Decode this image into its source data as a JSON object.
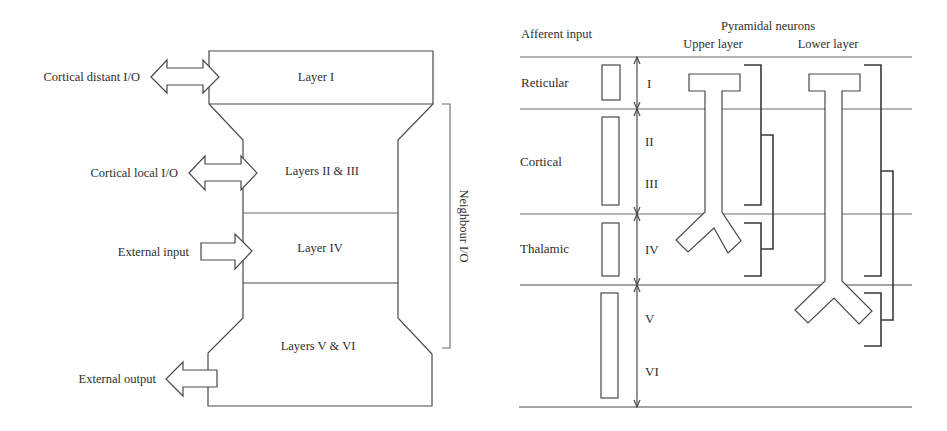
{
  "left_diagram": {
    "layers": [
      {
        "label": "Layer I"
      },
      {
        "label": "Layers II & III"
      },
      {
        "label": "Layer IV"
      },
      {
        "label": "Layers V & VI"
      }
    ],
    "connections": [
      {
        "label": "Cortical distant I/O",
        "direction": "bidirectional",
        "target": "Layer I"
      },
      {
        "label": "Cortical local I/O",
        "direction": "bidirectional",
        "target": "Layers II & III"
      },
      {
        "label": "External input",
        "direction": "in",
        "target": "Layer IV"
      },
      {
        "label": "External output",
        "direction": "out",
        "target": "Layers V & VI"
      }
    ],
    "neighbour_label": "Neighbour I/O"
  },
  "right_diagram": {
    "header_afferent": "Afferent input",
    "header_pyramidal": "Pyramidal neurons",
    "header_upper": "Upper layer",
    "header_lower": "Lower layer",
    "afferent_rows": [
      {
        "label": "Reticular"
      },
      {
        "label": "Cortical"
      },
      {
        "label": "Thalamic"
      }
    ],
    "layer_numerals": [
      "I",
      "II",
      "III",
      "IV",
      "V",
      "VI"
    ]
  },
  "colors": {
    "line": "#4a4a4a",
    "text": "#2e2e2e",
    "background": "#ffffff"
  }
}
